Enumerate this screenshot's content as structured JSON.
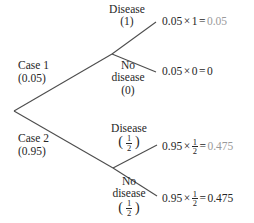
{
  "figure": {
    "type": "probability-tree-diagram",
    "title": "",
    "colors": {
      "line": "#4d4d4d",
      "text": "#262626",
      "dimmed_result": "#9a9a9a",
      "background": "#ffffff"
    }
  },
  "root": {
    "label": ""
  },
  "branches": {
    "case1": {
      "name": "Case 1",
      "probability": "(0.05)",
      "children": {
        "disease": {
          "line1": "Disease",
          "line2": "(1)",
          "value": "1"
        },
        "no_disease": {
          "line1": "No",
          "line2": "disease",
          "line3": "(0)",
          "value": "0"
        }
      }
    },
    "case2": {
      "name": "Case 2",
      "probability": "(0.95)",
      "children": {
        "disease": {
          "line1": "Disease",
          "fraction_numerator": "1",
          "fraction_denominator": "2"
        },
        "no_disease": {
          "line1": "No",
          "line2": "disease",
          "fraction_numerator": "1",
          "fraction_denominator": "2"
        }
      }
    }
  },
  "outcomes": [
    {
      "id": "outcome-1",
      "operand_left": "0.05",
      "times_symbol": "×",
      "operand_right": "1",
      "equals_symbol": "=",
      "result": "0.05",
      "result_style": "dimmed"
    },
    {
      "id": "outcome-2",
      "operand_left": "0.05",
      "times_symbol": "×",
      "operand_right": "0",
      "equals_symbol": "=",
      "result": "0",
      "result_style": "dark"
    },
    {
      "id": "outcome-3",
      "operand_left": "0.95",
      "times_symbol": "×",
      "operand_right_numerator": "1",
      "operand_right_denominator": "2",
      "equals_symbol": "=",
      "result": "0.475",
      "result_style": "dimmed"
    },
    {
      "id": "outcome-4",
      "operand_left": "0.95",
      "times_symbol": "×",
      "operand_right_numerator": "1",
      "operand_right_denominator": "2",
      "equals_symbol": "=",
      "result": "0.475",
      "result_style": "dark"
    }
  ]
}
